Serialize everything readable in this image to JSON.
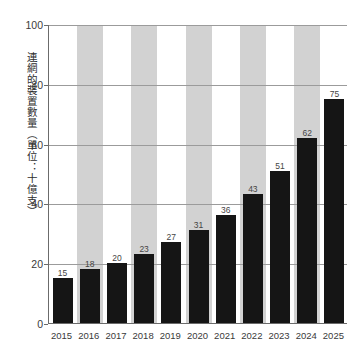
{
  "chart_data": {
    "type": "bar",
    "title": "",
    "subtitle": "",
    "xlabel": "",
    "ylabel": "連網的裝置數量（單位：十億支）",
    "categories": [
      "2015",
      "2016",
      "2017",
      "2018",
      "2019",
      "2020",
      "2021",
      "2022",
      "2023",
      "2024",
      "2025"
    ],
    "values": [
      15,
      18,
      20,
      23,
      27,
      31,
      36,
      43,
      51,
      62,
      75
    ],
    "value_labels": [
      "15",
      "18",
      "20",
      "23",
      "27",
      "31",
      "36",
      "43",
      "51",
      "62",
      "75"
    ],
    "ylim": [
      0,
      100
    ],
    "y_ticks": [
      0,
      20,
      40,
      60,
      80,
      100
    ],
    "y_tick_labels": [
      "0",
      "20",
      "40",
      "60",
      "80",
      "100"
    ],
    "grid": true,
    "grid_axis": "y",
    "legend": null,
    "legend_position": "none",
    "banded_columns": [
      1,
      3,
      5,
      7,
      9
    ],
    "colors": {
      "bar": "#151515",
      "band": "#d2d2d2",
      "gridline": "#9b9b9b",
      "axis": "#6b6b6b",
      "tick_text": "#3a3a3a",
      "value_text": "#454545",
      "background": "#ffffff"
    }
  }
}
